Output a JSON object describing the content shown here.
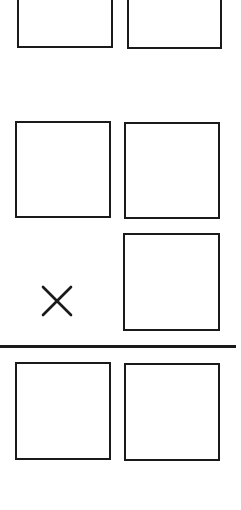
{
  "diagram": {
    "type": "vertical-multiplication-layout",
    "operator": {
      "symbol": "×",
      "name": "multiply"
    },
    "rows": [
      {
        "name": "top-partial-row",
        "boxes": 2,
        "values": [
          "",
          ""
        ]
      },
      {
        "name": "multiplicand-row",
        "boxes": 2,
        "values": [
          "",
          ""
        ]
      },
      {
        "name": "multiplier-row",
        "boxes": 1,
        "values": [
          ""
        ],
        "operator": "×"
      },
      {
        "name": "product-row",
        "boxes": 2,
        "values": [
          "",
          ""
        ]
      }
    ],
    "colors": {
      "stroke": "#1a1a1a",
      "background": "#ffffff"
    }
  }
}
